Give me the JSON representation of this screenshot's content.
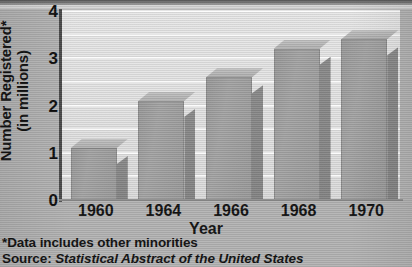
{
  "chart_data": {
    "type": "bar",
    "title": "",
    "xlabel": "Year",
    "ylabel_line1": "Number Registered*",
    "ylabel_line2": "(in millions)",
    "categories": [
      "1960",
      "1964",
      "1966",
      "1968",
      "1970"
    ],
    "values": [
      1.1,
      2.1,
      2.6,
      3.2,
      3.4
    ],
    "ylim": [
      0,
      4
    ],
    "yticks": [
      "0",
      "1",
      "2",
      "3",
      "4"
    ],
    "ytick_values": [
      0,
      1,
      2,
      3,
      4
    ],
    "minor_gridline_values": [
      0.5,
      1.5,
      2.5,
      3.5
    ],
    "grid": true,
    "legend": "none",
    "style_3d": true,
    "colors": {
      "bar_front": "#a0a0a0",
      "bar_top": "#bcbcbc",
      "bar_side": "#878787",
      "plot_background": "#e4e4e4",
      "page_background": "#b4b4b4",
      "gridline": "#fbfbfb",
      "axis": "#4a4a4a",
      "text": "#111111"
    }
  },
  "notes": {
    "footnote": "*Data includes other minorities",
    "source_prefix": "Source: ",
    "source_title": "Statistical Abstract of the United States"
  }
}
